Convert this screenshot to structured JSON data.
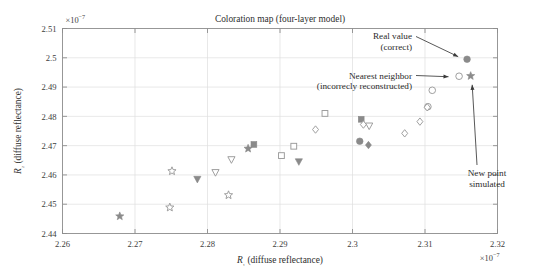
{
  "chart_data": {
    "type": "scatter",
    "title": "Coloration map (four-layer model)",
    "xlabel": "R₁ (diffuse reflectance)",
    "ylabel": "R₂ (diffuse reflectance)",
    "x_exponent": "×10⁻⁷",
    "y_exponent": "×10⁻⁷",
    "xlim": [
      2.26,
      2.32
    ],
    "ylim": [
      2.44,
      2.51
    ],
    "xticks": [
      2.26,
      2.27,
      2.28,
      2.29,
      2.3,
      2.31,
      2.32
    ],
    "xtick_labels": [
      "2.26",
      "2.27",
      "2.28",
      "2.29",
      "2.3",
      "2.31",
      "2.32"
    ],
    "yticks": [
      2.44,
      2.45,
      2.46,
      2.47,
      2.48,
      2.49,
      2.5,
      2.51
    ],
    "ytick_labels": [
      "2.44",
      "2.45",
      "2.46",
      "2.47",
      "2.48",
      "2.49",
      "2.5",
      "2.51"
    ],
    "grid": true,
    "legend": "none",
    "marker_color_filled": "#8a8a8a",
    "marker_color_open": "#9a9a9a",
    "points": [
      {
        "x": 2.2679,
        "y": 2.4459,
        "marker": "star",
        "fill": "filled"
      },
      {
        "x": 2.2748,
        "y": 2.4489,
        "marker": "star",
        "fill": "open"
      },
      {
        "x": 2.2751,
        "y": 2.4613,
        "marker": "star",
        "fill": "open"
      },
      {
        "x": 2.2786,
        "y": 2.4585,
        "marker": "triangle-down",
        "fill": "filled"
      },
      {
        "x": 2.2811,
        "y": 2.4608,
        "marker": "triangle-down",
        "fill": "open"
      },
      {
        "x": 2.2829,
        "y": 2.4531,
        "marker": "star",
        "fill": "open"
      },
      {
        "x": 2.2833,
        "y": 2.4652,
        "marker": "triangle-down",
        "fill": "open"
      },
      {
        "x": 2.2856,
        "y": 2.469,
        "marker": "star",
        "fill": "filled"
      },
      {
        "x": 2.2864,
        "y": 2.4704,
        "marker": "square",
        "fill": "filled"
      },
      {
        "x": 2.2902,
        "y": 2.4666,
        "marker": "square",
        "fill": "open"
      },
      {
        "x": 2.2919,
        "y": 2.4698,
        "marker": "square",
        "fill": "open"
      },
      {
        "x": 2.2926,
        "y": 2.4645,
        "marker": "triangle-down",
        "fill": "filled"
      },
      {
        "x": 2.2949,
        "y": 2.4755,
        "marker": "diamond",
        "fill": "open"
      },
      {
        "x": 2.2962,
        "y": 2.481,
        "marker": "square",
        "fill": "open"
      },
      {
        "x": 2.3012,
        "y": 2.479,
        "marker": "square",
        "fill": "filled"
      },
      {
        "x": 2.3015,
        "y": 2.4772,
        "marker": "diamond",
        "fill": "open"
      },
      {
        "x": 2.3023,
        "y": 2.4767,
        "marker": "triangle-down",
        "fill": "open"
      },
      {
        "x": 2.301,
        "y": 2.4715,
        "marker": "circle",
        "fill": "filled"
      },
      {
        "x": 2.3022,
        "y": 2.4702,
        "marker": "diamond",
        "fill": "filled"
      },
      {
        "x": 2.3072,
        "y": 2.4742,
        "marker": "diamond",
        "fill": "open"
      },
      {
        "x": 2.311,
        "y": 2.4889,
        "marker": "circle",
        "fill": "open"
      },
      {
        "x": 2.3104,
        "y": 2.4833,
        "marker": "circle",
        "fill": "open"
      },
      {
        "x": 2.3103,
        "y": 2.4831,
        "marker": "diamond",
        "fill": "open"
      },
      {
        "x": 2.3093,
        "y": 2.4782,
        "marker": "diamond",
        "fill": "open"
      },
      {
        "x": 2.3158,
        "y": 2.4995,
        "marker": "circle",
        "fill": "filled",
        "role": "real-value"
      },
      {
        "x": 2.3147,
        "y": 2.4937,
        "marker": "circle",
        "fill": "open",
        "role": "nearest-neighbor"
      },
      {
        "x": 2.3163,
        "y": 2.4938,
        "marker": "star",
        "fill": "filled",
        "role": "new-point"
      }
    ],
    "annotations": [
      {
        "id": "real-value",
        "lines": [
          "Real value",
          "(correct)"
        ],
        "target_x": 2.3152,
        "target_y": 2.4992
      },
      {
        "id": "nearest-neighbor",
        "lines": [
          "Nearest neighbor",
          "(incorrecly reconstructed)"
        ],
        "target_x": 2.314,
        "target_y": 2.4937
      },
      {
        "id": "new-point",
        "lines": [
          "New point",
          "simulated"
        ],
        "target_x": 2.3163,
        "target_y": 2.493
      }
    ]
  }
}
